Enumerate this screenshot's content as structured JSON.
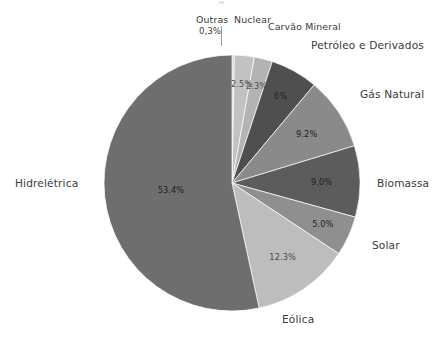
{
  "chart_data": {
    "type": "pie",
    "title": "",
    "subtitle": "",
    "xlabel": "",
    "ylabel": "",
    "legend_position": "none",
    "grid": false,
    "units": "percent",
    "start_angle_deg": 0,
    "direction": "clockwise",
    "categories": [
      "Outras",
      "Nuclear",
      "Carvão Mineral",
      "Petróleo e Derivados",
      "Gás Natural",
      "Biomassa",
      "Solar",
      "Eólica",
      "Hidrelétrica"
    ],
    "values": [
      0.3,
      2.5,
      2.3,
      6.0,
      9.2,
      9.0,
      5.0,
      12.3,
      53.4
    ],
    "value_labels": [
      "0,3%",
      "2.5%",
      "2.3%",
      "6%",
      "9.2%",
      "9.0%",
      "5.0%",
      "12.3%",
      "53.4%"
    ],
    "slice_colors": [
      "#d6d6d6",
      "#c2c2c2",
      "#b3b3b3",
      "#4f4f4f",
      "#8a8a8a",
      "#5c5c5c",
      "#8f8f8f",
      "#bdbdbd",
      "#6e6e6e"
    ],
    "slices": [
      {
        "name": "Outras",
        "value": 0.3,
        "label": "0,3%",
        "color": "#d6d6d6",
        "label_placement": "outside"
      },
      {
        "name": "Nuclear",
        "value": 2.5,
        "label": "2.5%",
        "color": "#c2c2c2",
        "label_placement": "inside"
      },
      {
        "name": "Carvão Mineral",
        "value": 2.3,
        "label": "2.3%",
        "color": "#b3b3b3",
        "label_placement": "inside"
      },
      {
        "name": "Petróleo e Derivados",
        "value": 6.0,
        "label": "6%",
        "color": "#4f4f4f",
        "label_placement": "inside"
      },
      {
        "name": "Gás Natural",
        "value": 9.2,
        "label": "9.2%",
        "color": "#8a8a8a",
        "label_placement": "inside"
      },
      {
        "name": "Biomassa",
        "value": 9.0,
        "label": "9.0%",
        "color": "#5c5c5c",
        "label_placement": "inside"
      },
      {
        "name": "Solar",
        "value": 5.0,
        "label": "5.0%",
        "color": "#8f8f8f",
        "label_placement": "inside"
      },
      {
        "name": "Eólica",
        "value": 12.3,
        "label": "12.3%",
        "color": "#bdbdbd",
        "label_placement": "inside"
      },
      {
        "name": "Hidrelétrica",
        "value": 53.4,
        "label": "53.4%",
        "color": "#6e6e6e",
        "label_placement": "inside"
      }
    ]
  },
  "labels": {
    "outras": "Outras",
    "outras_pct": "0,3%",
    "nuclear": "Nuclear",
    "nuclear_pct": "2.5%",
    "carvao": "Carvão Mineral",
    "carvao_pct": "2.3%",
    "petroleo": "Petróleo e Derivados",
    "petroleo_pct": "6%",
    "gas": "Gás Natural",
    "gas_pct": "9.2%",
    "biomassa": "Biomassa",
    "biomassa_pct": "9.0%",
    "solar": "Solar",
    "solar_pct": "5.0%",
    "eolica": "Eólica",
    "eolica_pct": "12.3%",
    "hidreletrica": "Hidrelétrica",
    "hidreletrica_pct": "53.4%"
  }
}
